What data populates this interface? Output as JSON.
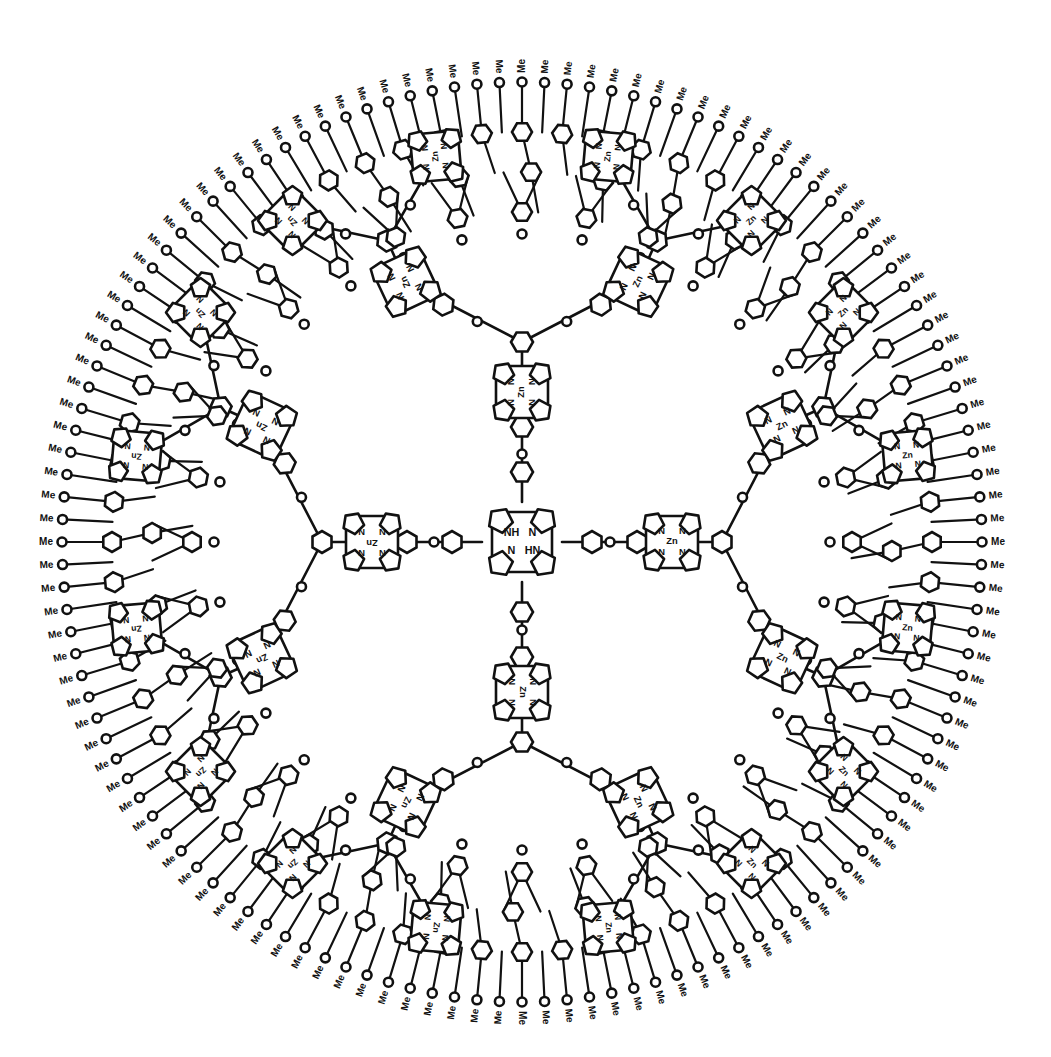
{
  "diagram": {
    "type": "chemical-structure",
    "ink_color": "#111111",
    "background": "#ffffff",
    "center": {
      "x": 522,
      "y": 542
    },
    "core": {
      "type": "free-base porphyrin",
      "labels": [
        "NH",
        "N",
        "N",
        "HN"
      ]
    },
    "zn_porphyrin_label": "Zn",
    "nitrogen_label": "N",
    "zn_inner_label": "N-Zn-N",
    "terminal_group_label": "Me",
    "arm_count": 4,
    "arms": [
      {
        "name": "top",
        "angle": -90
      },
      {
        "name": "right",
        "angle": 0
      },
      {
        "name": "bottom",
        "angle": 90
      },
      {
        "name": "left",
        "angle": 180
      }
    ],
    "generations": {
      "first_gen_porphyrins_per_arm": 1,
      "second_gen_porphyrins_per_arm": 2,
      "third_gen_porphyrins_per_arm": 2,
      "outer_radius": 480,
      "terminal_me_count": 128
    }
  }
}
